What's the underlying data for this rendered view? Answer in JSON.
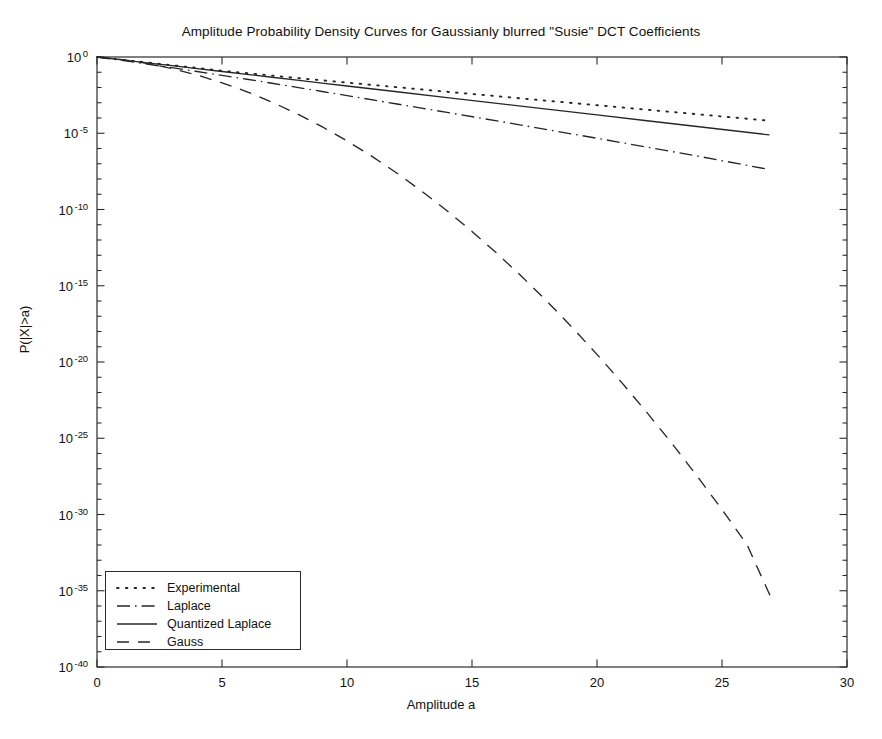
{
  "chart_data": {
    "type": "line",
    "title": "Amplitude Probability Density Curves for Gaussianly blurred \"Susie\" DCT Coefficients",
    "xlabel": "Amplitude a",
    "ylabel": "P(|X|>a)",
    "yscale": "log",
    "xlim": [
      0,
      30
    ],
    "ylim_exponent": [
      -40,
      0
    ],
    "grid": false,
    "legend_position": "lower left",
    "xticks": [
      0,
      5,
      10,
      15,
      20,
      25,
      30
    ],
    "xtick_labels": [
      "0",
      "5",
      "10",
      "15",
      "20",
      "25",
      "30"
    ],
    "ytick_exponents": [
      0,
      -5,
      -10,
      -15,
      -20,
      -25,
      -30,
      -35,
      -40
    ],
    "ytick_labels": [
      {
        "mantissa": "10",
        "exponent": "0"
      },
      {
        "mantissa": "10",
        "exponent": "-5"
      },
      {
        "mantissa": "10",
        "exponent": "-10"
      },
      {
        "mantissa": "10",
        "exponent": "-15"
      },
      {
        "mantissa": "10",
        "exponent": "-20"
      },
      {
        "mantissa": "10",
        "exponent": "-25"
      },
      {
        "mantissa": "10",
        "exponent": "-30"
      },
      {
        "mantissa": "10",
        "exponent": "-35"
      },
      {
        "mantissa": "10",
        "exponent": "-40"
      }
    ],
    "minor_ytick_step_decades": 1,
    "series": [
      {
        "name": "Experimental",
        "style": "dotted",
        "color": "#262626",
        "x": [
          0.0,
          1.0,
          2.0,
          3.0,
          4.0,
          5.0,
          6.0,
          7.0,
          8.0,
          9.0,
          10.0,
          12.0,
          14.0,
          16.0,
          18.0,
          20.0,
          22.0,
          24.0,
          26.9
        ],
        "y_log10": [
          0.0,
          -0.18,
          -0.36,
          -0.54,
          -0.72,
          -0.9,
          -1.06,
          -1.22,
          -1.38,
          -1.53,
          -1.68,
          -1.98,
          -2.28,
          -2.57,
          -2.87,
          -3.16,
          -3.46,
          -3.75,
          -4.18
        ]
      },
      {
        "name": "Laplace",
        "style": "dashdot",
        "color": "#262626",
        "x": [
          0.0,
          1.0,
          2.0,
          3.0,
          4.0,
          5.0,
          6.0,
          7.0,
          8.0,
          9.0,
          10.0,
          12.0,
          14.0,
          16.0,
          18.0,
          20.0,
          22.0,
          24.0,
          26.9
        ],
        "y_log10": [
          0.0,
          -0.22,
          -0.46,
          -0.7,
          -0.95,
          -1.2,
          -1.46,
          -1.72,
          -1.99,
          -2.26,
          -2.53,
          -3.08,
          -3.63,
          -4.19,
          -4.76,
          -5.33,
          -5.91,
          -6.49,
          -7.38
        ]
      },
      {
        "name": "Quantized Laplace",
        "style": "solid",
        "color": "#262626",
        "x": [
          0.0,
          1.0,
          2.0,
          3.0,
          4.0,
          5.0,
          6.0,
          7.0,
          8.0,
          9.0,
          10.0,
          12.0,
          14.0,
          16.0,
          18.0,
          20.0,
          22.0,
          24.0,
          26.9
        ],
        "y_log10": [
          0.0,
          -0.19,
          -0.38,
          -0.57,
          -0.76,
          -0.95,
          -1.14,
          -1.33,
          -1.52,
          -1.71,
          -1.9,
          -2.28,
          -2.66,
          -3.04,
          -3.42,
          -3.8,
          -4.18,
          -4.56,
          -5.11
        ]
      },
      {
        "name": "Gauss",
        "style": "dashed",
        "color": "#262626",
        "x": [
          0.0,
          1.0,
          2.0,
          3.0,
          4.0,
          5.0,
          6.0,
          7.0,
          8.0,
          9.0,
          10.0,
          11.0,
          12.0,
          13.0,
          14.0,
          15.0,
          16.0,
          17.0,
          18.0,
          19.0,
          20.0,
          21.0,
          22.0,
          23.0,
          24.0,
          25.0,
          26.0,
          27.0
        ],
        "y_log10": [
          0.0,
          -0.17,
          -0.42,
          -0.76,
          -1.18,
          -1.69,
          -2.28,
          -2.96,
          -3.72,
          -4.57,
          -5.5,
          -6.52,
          -7.62,
          -8.81,
          -10.08,
          -11.44,
          -12.88,
          -14.41,
          -16.02,
          -17.72,
          -19.5,
          -21.37,
          -23.32,
          -25.35,
          -27.47,
          -29.68,
          -31.97,
          -35.6
        ]
      }
    ]
  },
  "legend": {
    "items": [
      {
        "label": "Experimental",
        "style": "dotted"
      },
      {
        "label": "Laplace",
        "style": "dashdot"
      },
      {
        "label": "Quantized Laplace",
        "style": "solid"
      },
      {
        "label": "Gauss",
        "style": "dashed"
      }
    ]
  },
  "axes": {
    "frame_color": "#2b2b2b"
  }
}
